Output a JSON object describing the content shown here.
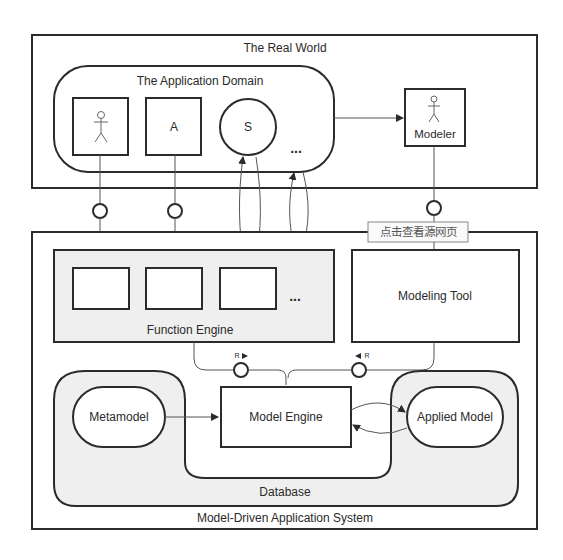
{
  "diagram": {
    "real_world": {
      "title": "The Real World"
    },
    "application_domain": {
      "title": "The Application Domain",
      "elements": [
        {
          "type": "actor",
          "label": ""
        },
        {
          "type": "box",
          "label": "A"
        },
        {
          "type": "circle",
          "label": "S"
        },
        {
          "type": "ellipsis",
          "label": "..."
        }
      ]
    },
    "modeler": {
      "label": "Modeler"
    },
    "watermark": {
      "label": "点击查看源网页"
    },
    "system": {
      "title": "Model-Driven Application System",
      "function_engine": {
        "title": "Function Engine",
        "ellipsis": "..."
      },
      "modeling_tool": {
        "title": "Modeling Tool"
      },
      "interfaces": {
        "left_label": "R",
        "right_label": "R"
      },
      "database": {
        "title": "Database",
        "metamodel": "Metamodel",
        "model_engine": "Model Engine",
        "applied_model": "Applied Model"
      }
    }
  }
}
